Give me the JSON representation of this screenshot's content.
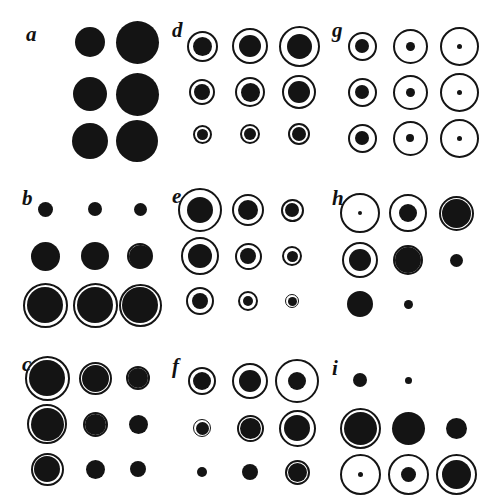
{
  "figure": {
    "type": "scientific-figure-multipanel",
    "background_color": "#ffffff",
    "ink_color": "#141414",
    "panel_labels": [
      "a",
      "b",
      "c",
      "d",
      "e",
      "f",
      "g",
      "h",
      "i"
    ],
    "rows": 3,
    "cols": 3,
    "panel_origins": [
      {
        "label": "a",
        "x": 0,
        "y": 0
      },
      {
        "label": "d",
        "x": 160,
        "y": 0
      },
      {
        "label": "g",
        "x": 320,
        "y": 0
      },
      {
        "label": "b",
        "x": 0,
        "y": 168
      },
      {
        "label": "e",
        "x": 160,
        "y": 168
      },
      {
        "label": "h",
        "x": 320,
        "y": 168
      },
      {
        "label": "c",
        "x": 0,
        "y": 336
      },
      {
        "label": "f",
        "x": 160,
        "y": 336
      },
      {
        "label": "i",
        "x": 320,
        "y": 336
      }
    ]
  },
  "chart_data": {
    "type": "scatter",
    "title": "",
    "xlabel": "",
    "ylabel": "",
    "grid": false,
    "legend": null,
    "note": "Each panel plots a 3x3 matrix of bubble glyphs. For every cell: ring = outer open circle diameter in px (0 = absent), dot = inner filled disc diameter in px (0 = absent). cx / cy are cell centre offsets within the panel.",
    "panels": [
      {
        "label": "a",
        "label_pos": {
          "x": 26,
          "y": 24
        },
        "col_x": [
          90,
          135
        ],
        "row_y": [
          42,
          94,
          141
        ],
        "cells": [
          {
            "row": 0,
            "col": 0,
            "cx": 90,
            "cy": 42,
            "ring": 0,
            "dot": 30
          },
          {
            "row": 0,
            "col": 1,
            "cx": 137,
            "cy": 42,
            "ring": 0,
            "dot": 43
          },
          {
            "row": 1,
            "col": 0,
            "cx": 90,
            "cy": 94,
            "ring": 0,
            "dot": 34
          },
          {
            "row": 1,
            "col": 1,
            "cx": 137,
            "cy": 94,
            "ring": 0,
            "dot": 43
          },
          {
            "row": 2,
            "col": 0,
            "cx": 90,
            "cy": 141,
            "ring": 0,
            "dot": 36
          },
          {
            "row": 2,
            "col": 1,
            "cx": 137,
            "cy": 141,
            "ring": 0,
            "dot": 42
          }
        ]
      },
      {
        "label": "b",
        "label_pos": {
          "x": 22,
          "y": 20
        },
        "col_x": [
          45,
          95,
          140
        ],
        "row_y": [
          41,
          88,
          137
        ],
        "cells": [
          {
            "row": 0,
            "col": 0,
            "cx": 45,
            "cy": 41,
            "ring": 0,
            "dot": 15
          },
          {
            "row": 0,
            "col": 1,
            "cx": 95,
            "cy": 41,
            "ring": 0,
            "dot": 14
          },
          {
            "row": 0,
            "col": 2,
            "cx": 140,
            "cy": 41,
            "ring": 0,
            "dot": 13
          },
          {
            "row": 1,
            "col": 0,
            "cx": 45,
            "cy": 88,
            "ring": 0,
            "dot": 29
          },
          {
            "row": 1,
            "col": 1,
            "cx": 95,
            "cy": 88,
            "ring": 0,
            "dot": 28
          },
          {
            "row": 1,
            "col": 2,
            "cx": 140,
            "cy": 88,
            "ring": 26,
            "dot": 23
          },
          {
            "row": 2,
            "col": 0,
            "cx": 45,
            "cy": 137,
            "ring": 45,
            "dot": 36
          },
          {
            "row": 2,
            "col": 1,
            "cx": 95,
            "cy": 137,
            "ring": 45,
            "dot": 36
          },
          {
            "row": 2,
            "col": 2,
            "cx": 140,
            "cy": 137,
            "ring": 43,
            "dot": 36
          }
        ]
      },
      {
        "label": "c",
        "label_pos": {
          "x": 22,
          "y": 18
        },
        "col_x": [
          47,
          95,
          138
        ],
        "row_y": [
          42,
          88,
          133
        ],
        "cells": [
          {
            "row": 0,
            "col": 0,
            "cx": 47,
            "cy": 42,
            "ring": 45,
            "dot": 36
          },
          {
            "row": 0,
            "col": 1,
            "cx": 95,
            "cy": 42,
            "ring": 33,
            "dot": 27
          },
          {
            "row": 0,
            "col": 2,
            "cx": 138,
            "cy": 42,
            "ring": 24,
            "dot": 20
          },
          {
            "row": 1,
            "col": 0,
            "cx": 47,
            "cy": 88,
            "ring": 40,
            "dot": 33
          },
          {
            "row": 1,
            "col": 1,
            "cx": 95,
            "cy": 88,
            "ring": 25,
            "dot": 21
          },
          {
            "row": 1,
            "col": 2,
            "cx": 138,
            "cy": 88,
            "ring": 0,
            "dot": 19
          },
          {
            "row": 2,
            "col": 0,
            "cx": 47,
            "cy": 133,
            "ring": 33,
            "dot": 26
          },
          {
            "row": 2,
            "col": 1,
            "cx": 95,
            "cy": 133,
            "ring": 0,
            "dot": 19
          },
          {
            "row": 2,
            "col": 2,
            "cx": 138,
            "cy": 133,
            "ring": 0,
            "dot": 16
          }
        ]
      },
      {
        "label": "d",
        "label_pos": {
          "x": 12,
          "y": 20
        },
        "col_x": [
          42,
          90,
          139
        ],
        "row_y": [
          46,
          92,
          134
        ],
        "cells": [
          {
            "row": 0,
            "col": 0,
            "cx": 42,
            "cy": 46,
            "ring": 31,
            "dot": 19
          },
          {
            "row": 0,
            "col": 1,
            "cx": 90,
            "cy": 46,
            "ring": 36,
            "dot": 22
          },
          {
            "row": 0,
            "col": 2,
            "cx": 139,
            "cy": 46,
            "ring": 41,
            "dot": 25
          },
          {
            "row": 1,
            "col": 0,
            "cx": 42,
            "cy": 92,
            "ring": 26,
            "dot": 16
          },
          {
            "row": 1,
            "col": 1,
            "cx": 90,
            "cy": 92,
            "ring": 30,
            "dot": 19
          },
          {
            "row": 1,
            "col": 2,
            "cx": 139,
            "cy": 92,
            "ring": 34,
            "dot": 22
          },
          {
            "row": 2,
            "col": 0,
            "cx": 42,
            "cy": 134,
            "ring": 19,
            "dot": 11
          },
          {
            "row": 2,
            "col": 1,
            "cx": 90,
            "cy": 134,
            "ring": 20,
            "dot": 12
          },
          {
            "row": 2,
            "col": 2,
            "cx": 139,
            "cy": 134,
            "ring": 22,
            "dot": 14
          }
        ]
      },
      {
        "label": "e",
        "label_pos": {
          "x": 12,
          "y": 18
        },
        "col_x": [
          40,
          88,
          132
        ],
        "row_y": [
          42,
          88,
          133
        ],
        "cells": [
          {
            "row": 0,
            "col": 0,
            "cx": 40,
            "cy": 42,
            "ring": 44,
            "dot": 26
          },
          {
            "row": 0,
            "col": 1,
            "cx": 88,
            "cy": 42,
            "ring": 32,
            "dot": 20
          },
          {
            "row": 0,
            "col": 2,
            "cx": 132,
            "cy": 42,
            "ring": 23,
            "dot": 14
          },
          {
            "row": 1,
            "col": 0,
            "cx": 40,
            "cy": 88,
            "ring": 38,
            "dot": 24
          },
          {
            "row": 1,
            "col": 1,
            "cx": 88,
            "cy": 88,
            "ring": 27,
            "dot": 16
          },
          {
            "row": 1,
            "col": 2,
            "cx": 132,
            "cy": 88,
            "ring": 20,
            "dot": 11
          },
          {
            "row": 2,
            "col": 0,
            "cx": 40,
            "cy": 133,
            "ring": 28,
            "dot": 16
          },
          {
            "row": 2,
            "col": 1,
            "cx": 88,
            "cy": 133,
            "ring": 20,
            "dot": 10
          },
          {
            "row": 2,
            "col": 2,
            "cx": 132,
            "cy": 133,
            "ring": 14,
            "dot": 9
          }
        ]
      },
      {
        "label": "f",
        "label_pos": {
          "x": 12,
          "y": 20
        },
        "col_x": [
          42,
          90,
          137
        ],
        "row_y": [
          45,
          92,
          136
        ],
        "cells": [
          {
            "row": 0,
            "col": 0,
            "cx": 42,
            "cy": 45,
            "ring": 28,
            "dot": 18
          },
          {
            "row": 0,
            "col": 1,
            "cx": 90,
            "cy": 45,
            "ring": 36,
            "dot": 22
          },
          {
            "row": 0,
            "col": 2,
            "cx": 137,
            "cy": 45,
            "ring": 44,
            "dot": 18
          },
          {
            "row": 1,
            "col": 0,
            "cx": 42,
            "cy": 92,
            "ring": 18,
            "dot": 13
          },
          {
            "row": 1,
            "col": 1,
            "cx": 90,
            "cy": 92,
            "ring": 27,
            "dot": 21
          },
          {
            "row": 1,
            "col": 2,
            "cx": 137,
            "cy": 92,
            "ring": 37,
            "dot": 26
          },
          {
            "row": 2,
            "col": 0,
            "cx": 42,
            "cy": 136,
            "ring": 0,
            "dot": 10
          },
          {
            "row": 2,
            "col": 1,
            "cx": 90,
            "cy": 136,
            "ring": 0,
            "dot": 16
          },
          {
            "row": 2,
            "col": 2,
            "cx": 137,
            "cy": 136,
            "ring": 25,
            "dot": 19
          }
        ]
      },
      {
        "label": "g",
        "label_pos": {
          "x": 12,
          "y": 20
        },
        "col_x": [
          42,
          90,
          139
        ],
        "row_y": [
          46,
          92,
          138
        ],
        "cells": [
          {
            "row": 0,
            "col": 0,
            "cx": 42,
            "cy": 46,
            "ring": 29,
            "dot": 14
          },
          {
            "row": 0,
            "col": 1,
            "cx": 90,
            "cy": 46,
            "ring": 35,
            "dot": 9
          },
          {
            "row": 0,
            "col": 2,
            "cx": 139,
            "cy": 46,
            "ring": 39,
            "dot": 5
          },
          {
            "row": 1,
            "col": 0,
            "cx": 42,
            "cy": 92,
            "ring": 29,
            "dot": 14
          },
          {
            "row": 1,
            "col": 1,
            "cx": 90,
            "cy": 92,
            "ring": 35,
            "dot": 9
          },
          {
            "row": 1,
            "col": 2,
            "cx": 139,
            "cy": 92,
            "ring": 39,
            "dot": 5
          },
          {
            "row": 2,
            "col": 0,
            "cx": 42,
            "cy": 138,
            "ring": 29,
            "dot": 14
          },
          {
            "row": 2,
            "col": 1,
            "cx": 90,
            "cy": 138,
            "ring": 35,
            "dot": 8
          },
          {
            "row": 2,
            "col": 2,
            "cx": 139,
            "cy": 138,
            "ring": 39,
            "dot": 5
          }
        ]
      },
      {
        "label": "h",
        "label_pos": {
          "x": 12,
          "y": 20
        },
        "col_x": [
          40,
          88,
          136
        ],
        "row_y": [
          45,
          92,
          136
        ],
        "cells": [
          {
            "row": 0,
            "col": 0,
            "cx": 40,
            "cy": 45,
            "ring": 40,
            "dot": 4
          },
          {
            "row": 0,
            "col": 1,
            "cx": 88,
            "cy": 45,
            "ring": 38,
            "dot": 18
          },
          {
            "row": 0,
            "col": 2,
            "cx": 136,
            "cy": 45,
            "ring": 35,
            "dot": 29
          },
          {
            "row": 1,
            "col": 0,
            "cx": 40,
            "cy": 92,
            "ring": 36,
            "dot": 22
          },
          {
            "row": 1,
            "col": 1,
            "cx": 88,
            "cy": 92,
            "ring": 30,
            "dot": 26
          },
          {
            "row": 1,
            "col": 2,
            "cx": 136,
            "cy": 92,
            "ring": 0,
            "dot": 13
          },
          {
            "row": 2,
            "col": 0,
            "cx": 40,
            "cy": 136,
            "ring": 26,
            "dot": 24
          },
          {
            "row": 2,
            "col": 1,
            "cx": 88,
            "cy": 136,
            "ring": 0,
            "dot": 9
          },
          {
            "row": 2,
            "col": 2,
            "cx": 136,
            "cy": 136,
            "ring": 0,
            "dot": 0
          }
        ]
      },
      {
        "label": "i",
        "label_pos": {
          "x": 12,
          "y": 22
        },
        "col_x": [
          40,
          88,
          136
        ],
        "row_y": [
          44,
          92,
          138
        ],
        "cells": [
          {
            "row": 0,
            "col": 0,
            "cx": 40,
            "cy": 44,
            "ring": 0,
            "dot": 14
          },
          {
            "row": 0,
            "col": 1,
            "cx": 88,
            "cy": 44,
            "ring": 0,
            "dot": 7
          },
          {
            "row": 0,
            "col": 2,
            "cx": 136,
            "cy": 44,
            "ring": 0,
            "dot": 0
          },
          {
            "row": 1,
            "col": 0,
            "cx": 40,
            "cy": 92,
            "ring": 41,
            "dot": 33
          },
          {
            "row": 1,
            "col": 1,
            "cx": 88,
            "cy": 92,
            "ring": 0,
            "dot": 33
          },
          {
            "row": 1,
            "col": 2,
            "cx": 136,
            "cy": 92,
            "ring": 0,
            "dot": 21
          },
          {
            "row": 2,
            "col": 0,
            "cx": 40,
            "cy": 138,
            "ring": 41,
            "dot": 5
          },
          {
            "row": 2,
            "col": 1,
            "cx": 88,
            "cy": 138,
            "ring": 41,
            "dot": 15
          },
          {
            "row": 2,
            "col": 2,
            "cx": 136,
            "cy": 138,
            "ring": 41,
            "dot": 29
          }
        ]
      }
    ]
  }
}
